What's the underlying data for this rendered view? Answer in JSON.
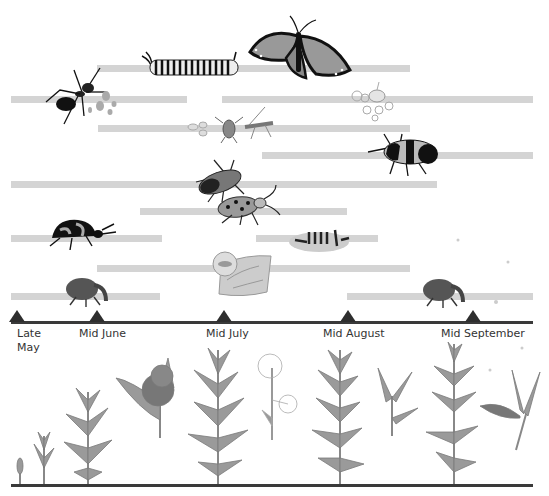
{
  "colors": {
    "bar": "#d4d4d4",
    "axis": "#3a3a3a",
    "marker": "#2e2e2e",
    "label": "#333333"
  },
  "timeline": {
    "ticks": [
      {
        "label": "Late\nMay",
        "x": 17
      },
      {
        "label": "Mid June",
        "x": 97
      },
      {
        "label": "Mid July",
        "x": 224
      },
      {
        "label": "Mid August",
        "x": 348
      },
      {
        "label": "Mid September",
        "x": 473
      }
    ]
  },
  "activity_bars": [
    {
      "insect": "monarch-butterfly-and-caterpillar",
      "y": 65,
      "x_start": 97,
      "x_end": 410
    },
    {
      "insect": "ant-tending-aphids",
      "y": 96,
      "x_start": 11,
      "x_end": 187
    },
    {
      "insect": "oleander-aphids",
      "y": 96,
      "x_start": 222,
      "x_end": 533
    },
    {
      "insect": "aphids-and-predators",
      "y": 125,
      "x_start": 98,
      "x_end": 410
    },
    {
      "insect": "large-milkweed-bug",
      "y": 152,
      "x_start": 262,
      "x_end": 533
    },
    {
      "insect": "small-milkweed-bug",
      "y": 181,
      "x_start": 11,
      "x_end": 437
    },
    {
      "insect": "red-milkweed-beetle",
      "y": 208,
      "x_start": 140,
      "x_end": 347
    },
    {
      "insect": "swamp-milkweed-leaf-beetle",
      "y": 235,
      "x_start": 11,
      "x_end": 162
    },
    {
      "insect": "milkweed-tussock-moth-caterpillar",
      "y": 235,
      "x_start": 256,
      "x_end": 378
    },
    {
      "insect": "leaf-miner",
      "y": 265,
      "x_start": 97,
      "x_end": 410
    },
    {
      "insect": "milkweed-stem-weevil",
      "y": 293,
      "x_start": 11,
      "x_end": 160
    },
    {
      "insect": "milkweed-pod-weevil",
      "y": 293,
      "x_start": 347,
      "x_end": 533
    }
  ],
  "plant_stages": [
    "sprout",
    "young-shoot",
    "leafy-stem",
    "flower-cluster",
    "tall-plant",
    "seed-head-flower",
    "mature-plant",
    "leaf-pair",
    "tall-plant-late",
    "open-pod-with-seeds"
  ]
}
